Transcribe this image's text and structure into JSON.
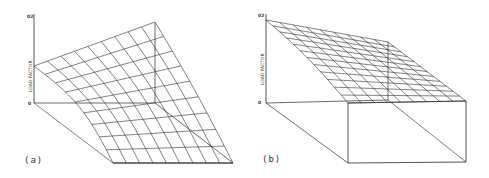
{
  "figure": {
    "panels": [
      {
        "id": "a",
        "label": "(a)",
        "axis_label": "LOAD FACTOR",
        "axis_max": "02",
        "axis_min": "0",
        "grid_rows": 9,
        "grid_cols": 9
      },
      {
        "id": "b",
        "label": "(b)",
        "axis_label": "LOAD FACTOR",
        "axis_max": "02",
        "axis_min": "0",
        "grid_rows": 9,
        "grid_cols": 12
      }
    ],
    "colors": {
      "line": "#2a2a2a",
      "background": "#ffffff"
    }
  }
}
